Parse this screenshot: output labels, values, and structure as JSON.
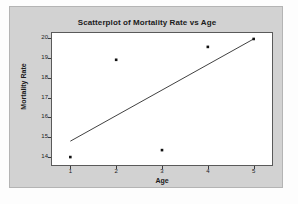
{
  "chart_data": {
    "type": "scatter",
    "title": "Scatterplot of Mortality Rate vs Age",
    "xlabel": "Age",
    "ylabel": "Mortality Rate",
    "x": [
      1,
      2,
      3,
      4,
      5
    ],
    "y": [
      14.0,
      18.9,
      14.35,
      19.55,
      19.95
    ],
    "points": [
      {
        "x": 1,
        "y": 14.0
      },
      {
        "x": 2,
        "y": 18.9
      },
      {
        "x": 3,
        "y": 14.35
      },
      {
        "x": 4,
        "y": 19.55
      },
      {
        "x": 5,
        "y": 19.95
      }
    ],
    "xticks": [
      "1",
      "2",
      "3",
      "4",
      "5"
    ],
    "yticks": [
      "14",
      "15",
      "16",
      "17",
      "18",
      "19",
      "20"
    ],
    "xlim": [
      0.6,
      5.4
    ],
    "ylim": [
      13.6,
      20.25
    ],
    "grid": false,
    "legend": false,
    "marker": "filled-square",
    "marker_color": "#111111",
    "trendline": {
      "type": "linear-fit",
      "x_start": 1.0,
      "y_start": 14.8,
      "x_end": 5.0,
      "y_end": 19.95,
      "color": "#2b2b2b"
    },
    "colors": {
      "panel_background": "#d2d2d2",
      "plot_background": "#ffffff",
      "axis": "#5a5a5a",
      "text": "#1b1b1b"
    }
  }
}
